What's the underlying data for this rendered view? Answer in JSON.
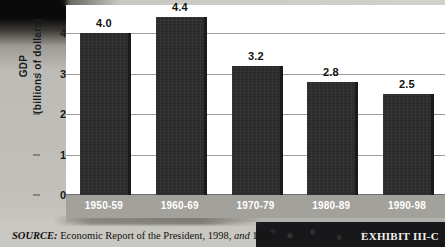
{
  "chart_data": {
    "type": "bar",
    "title": "",
    "subtitle": "",
    "xlabel": "",
    "ylabel_line1": "GDP",
    "ylabel_line2": "(billions of dollars)",
    "categories": [
      "1950-59",
      "1960-69",
      "1970-79",
      "1980-89",
      "1990-98"
    ],
    "values": [
      4.0,
      4.4,
      3.2,
      2.8,
      2.5
    ],
    "value_labels": [
      "4.0",
      "4.4",
      "3.2",
      "2.8",
      "2.5"
    ],
    "ylim": [
      0,
      4.7
    ],
    "yticks": [
      0,
      1,
      2,
      3,
      4
    ],
    "ytick_labels": [
      "0",
      "1",
      "2",
      "3",
      "4"
    ],
    "grid": true,
    "legend": false,
    "legend_position": "none",
    "bar_color": "#2b2b2b",
    "plot_background": "#ffffff",
    "gridline_color": "#9d9d9d",
    "xband_color": "#a3a19c",
    "xlabel_color": "#ffffff"
  },
  "footer": {
    "source_caption": "SOURCE:",
    "source_text_a": "Economic Report of the President, 1998,",
    "source_text_em": "and",
    "source_text_b": "1999.",
    "exhibit_label": "EXHIBIT III-C"
  }
}
